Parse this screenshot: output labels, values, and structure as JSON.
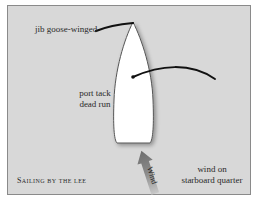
{
  "diagram": {
    "caption": "Sailing by the lee",
    "labels": {
      "jib": "jib goose-winged",
      "tack_line1": "port tack",
      "tack_line2": "dead run",
      "wind_line1": "wind on",
      "wind_line2": "starboard quarter"
    },
    "arrow_label": "Wind",
    "colors": {
      "background": "#d8d8d8",
      "hull": "#ffffff",
      "hull_outline": "#555555",
      "sail_line": "#111111",
      "arrow": "#7a7a7a",
      "text": "#2a2a2a"
    }
  }
}
